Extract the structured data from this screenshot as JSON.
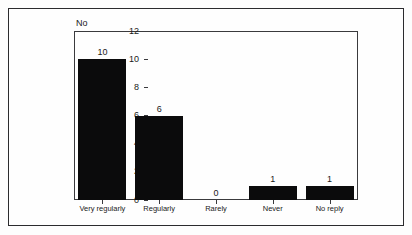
{
  "chart_data": {
    "type": "bar",
    "title": "",
    "xlabel": "",
    "ylabel": "No",
    "categories": [
      "Very regularly",
      "Regularly",
      "Rarely",
      "Never",
      "No reply"
    ],
    "values": [
      10,
      6,
      0,
      1,
      1
    ],
    "value_labels": [
      "10",
      "6",
      "0",
      "1",
      "1"
    ],
    "ylim": [
      0,
      12
    ],
    "yticks": [
      0,
      2,
      4,
      6,
      8,
      10,
      12
    ],
    "ytick_labels": [
      "0",
      "2",
      "4",
      "6",
      "8",
      "10",
      "12"
    ],
    "grid": false,
    "legend": false,
    "legend_position": "none",
    "bar_color": "#0b0b0c",
    "axis_color": "#3a3a3d",
    "text_color": "#1a1a1a",
    "background_color": "#fefefe",
    "frame_color": "#2b2b2e"
  }
}
